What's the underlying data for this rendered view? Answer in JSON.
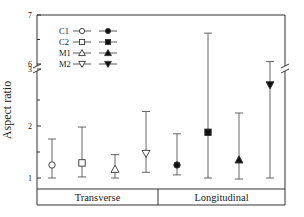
{
  "chart_data": {
    "type": "scatter",
    "title": "",
    "xlabel": "",
    "ylabel": "Aspect ratio",
    "y_axis": {
      "broken": true,
      "lower_range": [
        0.75,
        3.05
      ],
      "upper_range": [
        6,
        7
      ],
      "tick_labels": [
        "1",
        "2",
        "3",
        "6",
        "7"
      ],
      "minor_ticks": [
        1.5,
        2.5,
        6.5
      ]
    },
    "groups": [
      "Transverse",
      "Longitudinal"
    ],
    "legend": [
      {
        "name": "C1",
        "open_marker": "circle",
        "filled_marker": "circle"
      },
      {
        "name": "C2",
        "open_marker": "square",
        "filled_marker": "square"
      },
      {
        "name": "M1",
        "open_marker": "triangle-up",
        "filled_marker": "triangle-up"
      },
      {
        "name": "M2",
        "open_marker": "triangle-down",
        "filled_marker": "triangle-down"
      }
    ],
    "legend_position": "upper-left",
    "grid": false,
    "series": [
      {
        "group": "Transverse",
        "name": "C1",
        "marker": "circle",
        "filled": false,
        "value": 1.25,
        "err_low": 1.0,
        "err_high": 1.75
      },
      {
        "group": "Transverse",
        "name": "C2",
        "marker": "square",
        "filled": false,
        "value": 1.29,
        "err_low": 1.02,
        "err_high": 1.98
      },
      {
        "group": "Transverse",
        "name": "M1",
        "marker": "triangle-up",
        "filled": false,
        "value": 1.17,
        "err_low": 1.0,
        "err_high": 1.45
      },
      {
        "group": "Transverse",
        "name": "M2",
        "marker": "triangle-down",
        "filled": false,
        "value": 1.47,
        "err_low": 1.11,
        "err_high": 2.28
      },
      {
        "group": "Longitudinal",
        "name": "C1",
        "marker": "circle",
        "filled": true,
        "value": 1.25,
        "err_low": 1.06,
        "err_high": 1.85
      },
      {
        "group": "Longitudinal",
        "name": "C2",
        "marker": "square",
        "filled": true,
        "value": 1.88,
        "err_low": 1.0,
        "err_high": 6.63
      },
      {
        "group": "Longitudinal",
        "name": "M1",
        "marker": "triangle-up",
        "filled": true,
        "value": 1.35,
        "err_low": 0.98,
        "err_high": 2.25
      },
      {
        "group": "Longitudinal",
        "name": "M2",
        "marker": "triangle-down",
        "filled": true,
        "value": 2.79,
        "err_low": 1.0,
        "err_high": 6.05
      }
    ]
  }
}
